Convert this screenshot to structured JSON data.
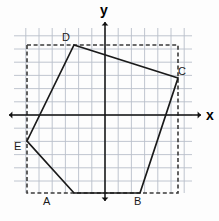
{
  "figure": {
    "kind": "coordinate-plane-polygon",
    "axes": {
      "x_label": "x",
      "y_label": "y",
      "origin_px": [
        105,
        115
      ]
    },
    "grid": {
      "cell_px": 13.2,
      "left_px": 14,
      "right_px": 192,
      "top_px": 28,
      "bottom_px": 193,
      "color": "#b9bfcb"
    },
    "polygon": {
      "name": "ABCDE",
      "stroke": "#1a1a1a",
      "vertices": [
        {
          "label": "A",
          "x_px": 74,
          "y_px": 193,
          "label_x_px": 43,
          "label_y_px": 196
        },
        {
          "label": "B",
          "x_px": 140,
          "y_px": 193,
          "label_x_px": 134,
          "label_y_px": 196
        },
        {
          "label": "C",
          "x_px": 178,
          "y_px": 78,
          "label_x_px": 178,
          "label_y_px": 66
        },
        {
          "label": "D",
          "x_px": 74,
          "y_px": 45,
          "label_x_px": 62,
          "label_y_px": 32
        },
        {
          "label": "E",
          "x_px": 27,
          "y_px": 141,
          "label_x_px": 14,
          "label_y_px": 141
        }
      ]
    },
    "bounding_box": {
      "style": "dashed",
      "stroke": "#3a3a3a",
      "left_px": 27,
      "right_px": 178,
      "top_px": 45,
      "bottom_px": 193
    }
  }
}
